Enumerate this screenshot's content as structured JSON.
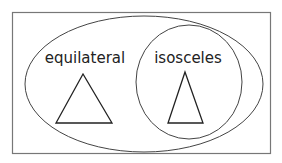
{
  "diagram": {
    "type": "venn",
    "outer_set": {
      "label": "equilateral",
      "shape_example": "equilateral-triangle"
    },
    "inner_set": {
      "label": "isosceles",
      "shape_example": "isosceles-triangle"
    },
    "colors": {
      "stroke": "#444444",
      "background": "#ffffff",
      "text": "#222222"
    }
  }
}
